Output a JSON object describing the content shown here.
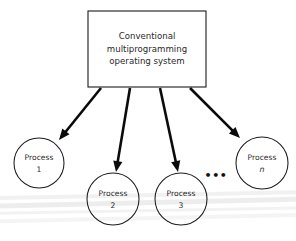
{
  "figure": {
    "background_color": "#ffffff",
    "stroke_color": "#1b1b1b",
    "arrow_color": "#0b0b0b",
    "text_color": "#2a2a2a",
    "width": 296,
    "height": 241
  },
  "os_box": {
    "line1": "Conventional",
    "line2": "multiprogramming",
    "line3": "operating system",
    "x": 88,
    "y": 11,
    "width": 118,
    "height": 76
  },
  "processes": [
    {
      "id": "process-1",
      "line1": "Process",
      "line2": "1",
      "cx": 39,
      "cy": 163,
      "r": 25,
      "italic_second_line": false
    },
    {
      "id": "process-2",
      "line1": "Process",
      "line2": "2",
      "cx": 113,
      "cy": 199,
      "r": 26,
      "italic_second_line": false
    },
    {
      "id": "process-3",
      "line1": "Process",
      "line2": "3",
      "cx": 181,
      "cy": 199,
      "r": 26,
      "italic_second_line": false
    },
    {
      "id": "process-n",
      "line1": "Process",
      "line2": "n",
      "cx": 262,
      "cy": 163,
      "r": 26,
      "italic_second_line": true
    }
  ],
  "ellipsis": {
    "label": "•••",
    "x": 216,
    "y": 176
  },
  "arrows": [
    {
      "id": "arrow-to-process-1",
      "x1": 101,
      "y1": 88,
      "x2": 59,
      "y2": 140
    },
    {
      "id": "arrow-to-process-2",
      "x1": 130,
      "y1": 88,
      "x2": 116,
      "y2": 172
    },
    {
      "id": "arrow-to-process-3",
      "x1": 160,
      "y1": 88,
      "x2": 178,
      "y2": 172
    },
    {
      "id": "arrow-to-process-n",
      "x1": 190,
      "y1": 88,
      "x2": 240,
      "y2": 138
    }
  ],
  "scan_artifacts": [
    {
      "id": "band-1",
      "top": 193,
      "height": 4,
      "opacity": 0.055,
      "rotate": -1.1
    },
    {
      "id": "band-2",
      "top": 200,
      "height": 5,
      "opacity": 0.07,
      "rotate": -1.3
    },
    {
      "id": "band-3",
      "top": 209,
      "height": 3,
      "opacity": 0.05,
      "rotate": -1.0
    },
    {
      "id": "band-4",
      "top": 216,
      "height": 4,
      "opacity": 0.045,
      "rotate": -1.2
    }
  ]
}
